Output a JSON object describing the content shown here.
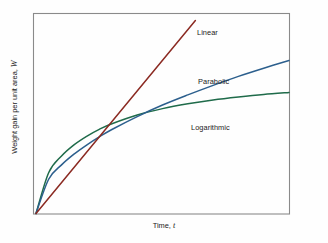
{
  "figure": {
    "background_color": "#fefefe",
    "frame_color": "#8a8a8a"
  },
  "axes": {
    "ylabel_prefix": "Weight gain per unit area, ",
    "ylabel_symbol": "W",
    "xlabel_prefix": "Time, ",
    "xlabel_symbol": "t"
  },
  "series_labels": {
    "linear": "Linear",
    "parabolic": "Parabolic",
    "logarithmic": "Logarithmic"
  },
  "chart_data": {
    "type": "line",
    "title": "",
    "subtitle": "",
    "xlabel": "Time, t",
    "ylabel": "Weight gain per unit area, W",
    "xlim": [
      0,
      1
    ],
    "ylim": [
      0,
      1
    ],
    "grid": false,
    "ticks": {
      "x": [],
      "y": []
    },
    "legend_position": "inline-curve-labels",
    "annotations": [
      {
        "text": "Linear",
        "x": 0.64,
        "y": 0.93,
        "color": "#8b2a22"
      },
      {
        "text": "Parabolic",
        "x": 0.65,
        "y": 0.69,
        "color": "#2c5f8d"
      },
      {
        "text": "Logarithmic",
        "x": 0.62,
        "y": 0.44,
        "color": "#1f6b4a"
      }
    ],
    "series": [
      {
        "name": "Linear",
        "color": "#8b2a22",
        "law": "W = k t",
        "x": [
          0.0,
          0.1,
          0.2,
          0.3,
          0.4,
          0.5,
          0.6,
          0.63
        ],
        "values": [
          0.0,
          0.155,
          0.31,
          0.465,
          0.62,
          0.775,
          0.93,
          0.97
        ]
      },
      {
        "name": "Parabolic",
        "color": "#2c5f8d",
        "law": "W^2 = k t",
        "x": [
          0.0,
          0.05,
          0.1,
          0.15,
          0.2,
          0.25,
          0.3,
          0.4,
          0.5,
          0.6,
          0.7,
          0.8,
          0.9,
          1.0
        ],
        "values": [
          0.0,
          0.172,
          0.243,
          0.298,
          0.344,
          0.385,
          0.422,
          0.487,
          0.545,
          0.596,
          0.644,
          0.689,
          0.73,
          0.769
        ]
      },
      {
        "name": "Logarithmic",
        "color": "#1f6b4a",
        "law": "W = k log(c t + 1)",
        "x": [
          0.0,
          0.05,
          0.1,
          0.15,
          0.2,
          0.25,
          0.3,
          0.4,
          0.5,
          0.6,
          0.7,
          0.8,
          0.9,
          1.0
        ],
        "values": [
          0.0,
          0.205,
          0.288,
          0.345,
          0.388,
          0.423,
          0.451,
          0.495,
          0.527,
          0.551,
          0.57,
          0.585,
          0.598,
          0.608
        ]
      }
    ]
  }
}
